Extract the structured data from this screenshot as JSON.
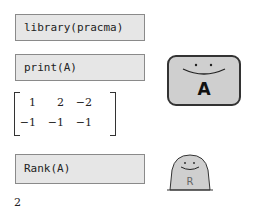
{
  "code_cells": [
    {
      "code": "library(pracma)"
    },
    {
      "code": "print(A)"
    },
    {
      "code": "Rank(A)"
    }
  ],
  "matrix": {
    "rows": [
      [
        "1",
        "2",
        "−2"
      ],
      [
        "−1",
        "−1",
        "−1"
      ]
    ]
  },
  "result": "2",
  "illustrations": {
    "a_card_letter": "A",
    "r_blob_letter": "R"
  }
}
